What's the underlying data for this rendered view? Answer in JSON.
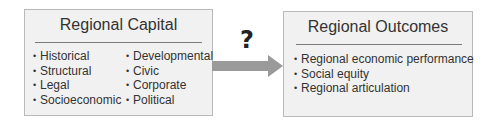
{
  "diagram": {
    "left_box": {
      "title": "Regional Capital",
      "column1": [
        "Historical",
        "Structural",
        "Legal",
        "Socioeconomic"
      ],
      "column2": [
        "Developmental",
        "Civic",
        "Corporate",
        "Political"
      ]
    },
    "connector": {
      "label": "?",
      "arrow_color": "#9a9a9a"
    },
    "right_box": {
      "title": "Regional Outcomes",
      "items": [
        "Regional economic performance",
        "Social equity",
        "Regional articulation"
      ]
    },
    "colors": {
      "box_fill": "#f1f1f1",
      "box_border": "#b9b9b9"
    }
  }
}
